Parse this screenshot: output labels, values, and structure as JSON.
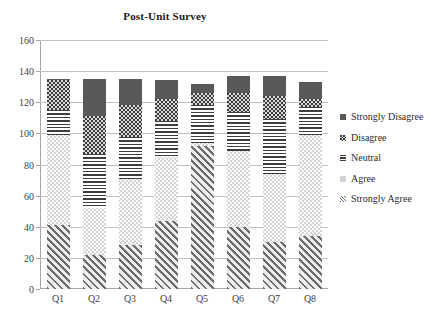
{
  "chart_data": {
    "type": "bar",
    "subtype": "stacked-bar",
    "title": "Post-Unit Survey",
    "xlabel": "",
    "ylabel": "",
    "categories": [
      "Q1",
      "Q2",
      "Q3",
      "Q4",
      "Q5",
      "Q6",
      "Q7",
      "Q8"
    ],
    "ylim": [
      0,
      160
    ],
    "yticks": [
      0,
      20,
      40,
      60,
      80,
      100,
      120,
      140,
      160
    ],
    "grid": true,
    "legend_position": "right",
    "series": [
      {
        "name": "Strongly Agree",
        "values": [
          41,
          22,
          28,
          44,
          92,
          40,
          30,
          34
        ]
      },
      {
        "name": "Agree",
        "values": [
          58,
          30,
          43,
          41,
          2,
          49,
          44,
          65
        ]
      },
      {
        "name": "Neutral",
        "values": [
          16,
          35,
          27,
          23,
          24,
          25,
          35,
          18
        ]
      },
      {
        "name": "Disagree",
        "values": [
          19,
          24,
          20,
          14,
          8,
          12,
          15,
          5
        ]
      },
      {
        "name": "Strongly Disagree",
        "values": [
          1,
          24,
          17,
          12,
          6,
          11,
          13,
          11
        ]
      }
    ],
    "totals": [
      135,
      135,
      135,
      134,
      132,
      137,
      137,
      133
    ],
    "stack_order_bottom_to_top": [
      "Strongly Agree",
      "Agree",
      "Neutral",
      "Disagree",
      "Strongly Disagree"
    ],
    "legend_entries": [
      {
        "label": "Strongly Disagree",
        "pattern": "solid-dark-grey",
        "color": "#595959"
      },
      {
        "label": "Disagree",
        "pattern": "dark-checker",
        "color": "#3b3b3b"
      },
      {
        "label": "Neutral",
        "pattern": "horizontal-lines",
        "color": "#3d3d3d"
      },
      {
        "label": "Agree",
        "pattern": "light-dots",
        "color": "#d4d4d4"
      },
      {
        "label": "Strongly Agree",
        "pattern": "diagonal-hatch",
        "color": "#6b6b6b"
      }
    ]
  }
}
